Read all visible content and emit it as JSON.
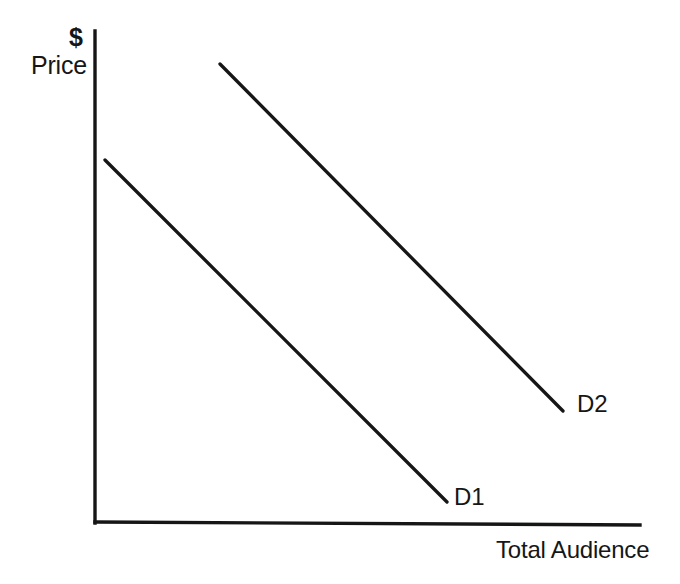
{
  "chart_data": {
    "type": "line",
    "title": "",
    "subtitle": "",
    "xlabel": "Total Audience",
    "ylabel": "Price",
    "ylabel_unit": "$",
    "xlim": [
      0,
      100
    ],
    "ylim": [
      0,
      100
    ],
    "grid": false,
    "axis_ticks": false,
    "legend": "inline-end-labels",
    "series": [
      {
        "name": "D1",
        "label": "D1",
        "color": "#161616",
        "points": [
          {
            "x": 2,
            "y": 74
          },
          {
            "x": 65,
            "y": 4
          }
        ],
        "pixel_start": {
          "x": 105,
          "y": 160
        },
        "pixel_end": {
          "x": 447,
          "y": 502
        },
        "slope": -1.0
      },
      {
        "name": "D2",
        "label": "D2",
        "color": "#161616",
        "points": [
          {
            "x": 23,
            "y": 94
          },
          {
            "x": 86,
            "y": 23
          }
        ],
        "pixel_start": {
          "x": 220,
          "y": 64
        },
        "pixel_end": {
          "x": 563,
          "y": 411
        },
        "slope": -1.01
      }
    ],
    "annotations": [
      {
        "text": "$",
        "role": "y-axis-currency-symbol"
      },
      {
        "text": "Price",
        "role": "y-axis-title"
      },
      {
        "text": "Total Audience",
        "role": "x-axis-title"
      },
      {
        "text": "D1",
        "role": "series-end-label"
      },
      {
        "text": "D2",
        "role": "series-end-label"
      }
    ]
  },
  "axes": {
    "y_axis": {
      "x1": 95,
      "y1": 31,
      "x2": 95,
      "y2": 523
    },
    "x_axis": {
      "x1": 95,
      "y1": 522,
      "x2": 640,
      "y2": 525
    }
  },
  "labels": {
    "dollar": "$",
    "price": "Price",
    "total_audience": "Total Audience",
    "d1": "D1",
    "d2": "D2"
  },
  "colors": {
    "ink": "#161616",
    "background": "#ffffff"
  }
}
